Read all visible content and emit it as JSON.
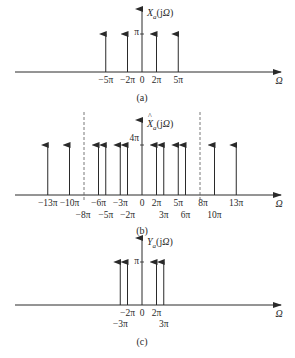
{
  "figure": {
    "colors": {
      "line": "#2a2a2a",
      "dashed": "#555555",
      "background": "#ffffff"
    },
    "x_axis_label": "Ω",
    "panels": [
      {
        "id": "a",
        "caption": "(a)",
        "y_label": {
          "main": "X",
          "sub": "a",
          "arg": "(jΩ)",
          "hat": false
        },
        "amplitude_label": "π",
        "impulses": [
          {
            "omega_pi": -5,
            "label": "−5π",
            "row": 1
          },
          {
            "omega_pi": -2,
            "label": "−2π",
            "row": 1
          },
          {
            "omega_pi": 2,
            "label": "2π",
            "row": 1
          },
          {
            "omega_pi": 5,
            "label": "5π",
            "row": 1
          }
        ],
        "origin_label": "0",
        "dashed_lines": []
      },
      {
        "id": "b",
        "caption": "(b)",
        "y_label": {
          "main": "X",
          "sub": "a",
          "arg": "(jΩ)",
          "hat": true
        },
        "amplitude_label": "4π",
        "impulses": [
          {
            "omega_pi": -13,
            "label": "−13π",
            "row": 1
          },
          {
            "omega_pi": -10,
            "label": "−10π",
            "row": 1
          },
          {
            "omega_pi": -6,
            "label": "−6π",
            "row": 1
          },
          {
            "omega_pi": -5,
            "label": "−5π",
            "row": 2
          },
          {
            "omega_pi": -3,
            "label": "−3π",
            "row": 1
          },
          {
            "omega_pi": -2,
            "label": "−2π",
            "row": 2
          },
          {
            "omega_pi": 2,
            "label": "2π",
            "row": 1
          },
          {
            "omega_pi": 3,
            "label": "3π",
            "row": 2
          },
          {
            "omega_pi": 5,
            "label": "5π",
            "row": 1
          },
          {
            "omega_pi": 6,
            "label": "6π",
            "row": 2
          },
          {
            "omega_pi": 10,
            "label": "10π",
            "row": 2
          },
          {
            "omega_pi": 13,
            "label": "13π",
            "row": 1
          }
        ],
        "origin_label": "0",
        "dashed_lines": [
          {
            "omega_pi": -8,
            "label": "−8π",
            "row": 2
          },
          {
            "omega_pi": 8,
            "label": "8π",
            "row": 1
          }
        ]
      },
      {
        "id": "c",
        "caption": "(c)",
        "y_label": {
          "main": "Y",
          "sub": "a",
          "arg": "(jΩ)",
          "hat": false
        },
        "amplitude_label": "π",
        "impulses": [
          {
            "omega_pi": -3,
            "label": "−3π",
            "row": 2
          },
          {
            "omega_pi": -2,
            "label": "−2π",
            "row": 1
          },
          {
            "omega_pi": 2,
            "label": "2π",
            "row": 1
          },
          {
            "omega_pi": 3,
            "label": "3π",
            "row": 2
          }
        ],
        "origin_label": "0",
        "dashed_lines": []
      }
    ]
  }
}
